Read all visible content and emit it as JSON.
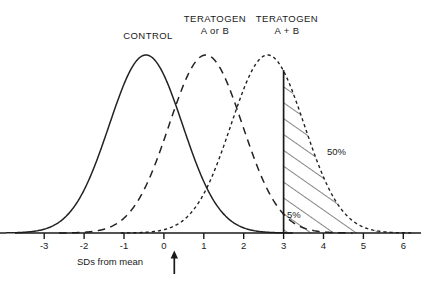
{
  "chart_data": {
    "type": "line",
    "title": "",
    "xlabel": "SDs from mean",
    "ylabel": "",
    "xlim": [
      -3.75,
      6.45
    ],
    "ylim": [
      0,
      1.08
    ],
    "grid": false,
    "legend_position": "above-curves",
    "x_ticks": [
      "-3",
      "-2",
      "-1",
      "0",
      "1",
      "2",
      "3",
      "4",
      "5",
      "6"
    ],
    "x_tick_values": [
      -3,
      -2,
      -1,
      0,
      1,
      2,
      3,
      4,
      5,
      6
    ],
    "series": [
      {
        "name": "CONTROL",
        "label_lines": [
          "CONTROL"
        ],
        "linestyle": "solid",
        "mean": -0.45,
        "sd": 0.92,
        "peak_x": -0.45,
        "peak_y": 1.0
      },
      {
        "name": "TERATOGEN A or B",
        "label_lines": [
          "TERATOGEN",
          "A or B"
        ],
        "linestyle": "dashed",
        "mean": 1.05,
        "sd": 0.92,
        "peak_x": 1.05,
        "peak_y": 1.0
      },
      {
        "name": "TERATOGEN A + B",
        "label_lines": [
          "TERATOGEN",
          "A + B"
        ],
        "linestyle": "dotted",
        "mean": 2.6,
        "sd": 0.92,
        "peak_x": 2.6,
        "peak_y": 1.0
      }
    ],
    "threshold_line_x": 3,
    "annotations": [
      {
        "name": "hatched-region-label",
        "text": "50%",
        "x": 3.55,
        "y": 0.52,
        "region": "hatched",
        "description": "area under TERATOGEN A + B curve to the right of x = 3"
      },
      {
        "name": "stippled-region-label",
        "text": "5%",
        "x": 3.3,
        "y": 0.075,
        "region": "stippled",
        "description": "area under CONTROL curve to the right of x = 3"
      }
    ],
    "axis_arrow": {
      "name": "mean-arrow",
      "points_to_x": 0,
      "direction": "up"
    }
  },
  "labels": {
    "control": "CONTROL",
    "teratogen_ab_line1": "TERATOGEN",
    "teratogen_ab_line2": "A or B",
    "teratogen_sum_line1": "TERATOGEN",
    "teratogen_sum_line2": "A + B",
    "pct_50": "50%",
    "pct_5": "5%",
    "axis_title": "SDs from mean"
  },
  "ticks": {
    "t0": "-3",
    "t1": "-2",
    "t2": "-1",
    "t3": "0",
    "t4": "1",
    "t5": "2",
    "t6": "3",
    "t7": "4",
    "t8": "5",
    "t9": "6"
  },
  "colors": {
    "ink": "#1a1a1a",
    "curve": "#222222",
    "hatch": "#333333",
    "stipple": "#9a9a9a",
    "background": "#ffffff"
  }
}
